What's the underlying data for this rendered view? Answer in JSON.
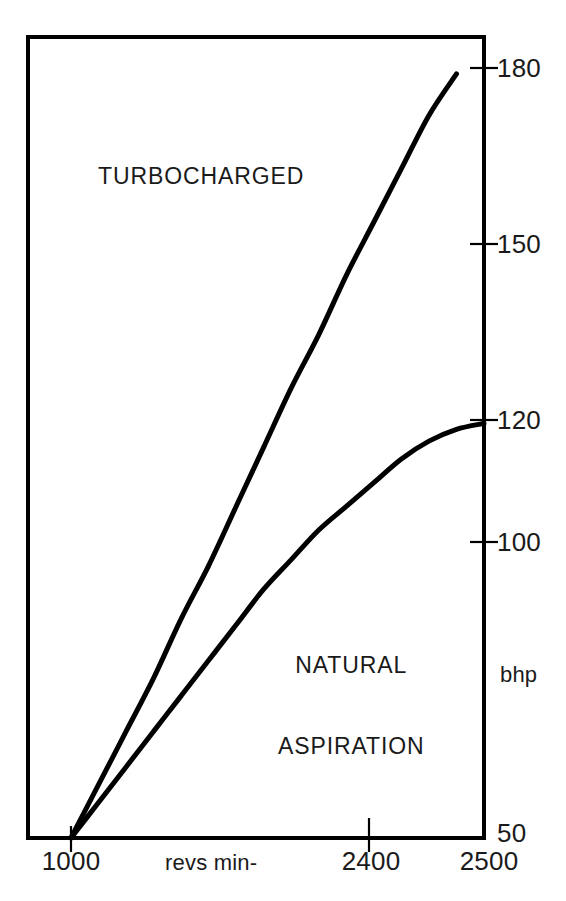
{
  "chart_data": {
    "type": "line",
    "title": "",
    "subtitle": "",
    "xlabel": "revs min-",
    "ylabel": "bhp",
    "grid": false,
    "legend_position": "inline-annotation",
    "xlim": [
      1000,
      2500
    ],
    "ylim": [
      50,
      180
    ],
    "x_ticks": [
      {
        "value": 1000,
        "label": "1000",
        "has_mark": true
      },
      {
        "value": 2400,
        "label": "2400",
        "has_mark": true
      },
      {
        "value": 2500,
        "label": "2500",
        "has_mark": false
      }
    ],
    "y_ticks": [
      {
        "value": 180,
        "label": "180",
        "has_mark": true
      },
      {
        "value": 150,
        "label": "150",
        "has_mark": true
      },
      {
        "value": 120,
        "label": "120",
        "has_mark": true
      },
      {
        "value": 100,
        "label": "100",
        "has_mark": true
      },
      {
        "value": 50,
        "label": "50",
        "has_mark": false
      }
    ],
    "series": [
      {
        "name": "TURBOCHARGED",
        "label_lines": [
          "TURBOCHARGED"
        ],
        "color": "#000000",
        "x": [
          1000,
          1100,
          1200,
          1300,
          1400,
          1500,
          1600,
          1700,
          1800,
          1900,
          2000,
          2100,
          2200,
          2300,
          2400
        ],
        "values": [
          50,
          59,
          68,
          77,
          87,
          96,
          106,
          116,
          126,
          135,
          145,
          154,
          163,
          172,
          179
        ]
      },
      {
        "name": "NATURAL ASPIRATION",
        "label_lines": [
          "NATURAL",
          "ASPIRATION"
        ],
        "color": "#000000",
        "x": [
          1000,
          1100,
          1200,
          1300,
          1400,
          1500,
          1600,
          1700,
          1800,
          1900,
          2000,
          2100,
          2200,
          2300,
          2400,
          2500
        ],
        "values": [
          50,
          56,
          62,
          68,
          74,
          80,
          86,
          92,
          97,
          102,
          106,
          110,
          114,
          117,
          119,
          120
        ]
      }
    ],
    "annotations": [
      {
        "text": "TURBOCHARGED",
        "x": 1250,
        "y": 163
      },
      {
        "text": "NATURAL ASPIRATION",
        "x": 1950,
        "y": 89
      },
      {
        "text": "bhp",
        "x": 2570,
        "y": 84
      },
      {
        "text": "revs min-",
        "x": 1400,
        "y": 45
      }
    ],
    "frame": {
      "line_color": "#000000",
      "line_width": 4,
      "background": "#ffffff"
    }
  }
}
